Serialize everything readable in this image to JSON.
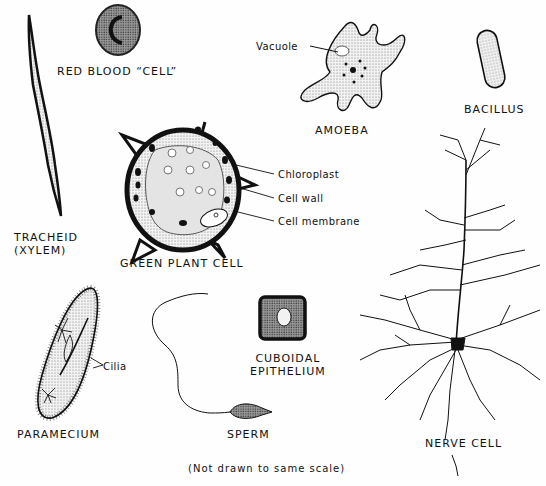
{
  "diagram": {
    "footnote": "(Not drawn to same scale)",
    "cells": {
      "tracheid": {
        "label_line1": "TRACHEID",
        "label_line2": "(XYLEM)"
      },
      "red_blood_cell": {
        "label": "RED BLOOD “CELL”"
      },
      "amoeba": {
        "label": "AMOEBA",
        "parts": {
          "vacuole": "Vacuole"
        }
      },
      "bacillus": {
        "label": "BACILLUS"
      },
      "green_plant_cell": {
        "label": "GREEN PLANT CELL",
        "parts": {
          "chloroplast": "Chloroplast",
          "cell_wall": "Cell wall",
          "cell_membrane": "Cell membrane"
        }
      },
      "paramecium": {
        "label": "PARAMECIUM",
        "parts": {
          "cilia": "Cilia"
        }
      },
      "sperm": {
        "label": "SPERM"
      },
      "cuboidal_epithelium": {
        "label_line1": "CUBOIDAL",
        "label_line2": "EPITHELIUM"
      },
      "nerve_cell": {
        "label": "NERVE CELL"
      }
    },
    "colors": {
      "ink": "#111111",
      "paper": "#fefefe",
      "stipple": "#e6e6e6",
      "cytoplasm": "#dcdcdc"
    }
  }
}
